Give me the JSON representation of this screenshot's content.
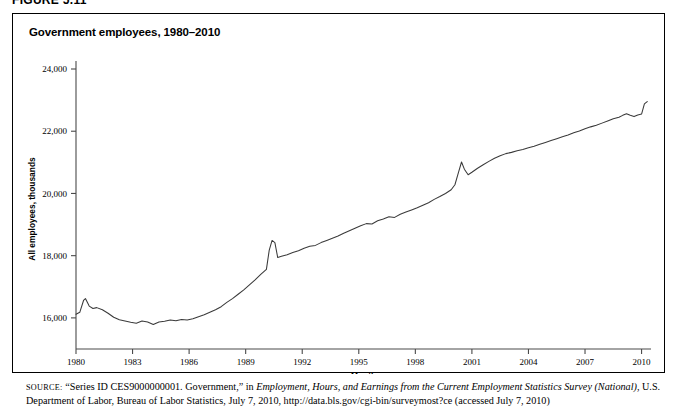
{
  "figure": {
    "number": "FIGURE 5.11"
  },
  "chart_panel": {
    "title": "Government employees, 1980–2010"
  },
  "source": {
    "label": "SOURCE:",
    "part1": " “Series ID CES9000000001. Government,” in ",
    "italic1": "Employment, Hours, and Earnings from the Current Employment Statistics Survey (National)",
    "part2": ", U.S. Department of Labor, Bureau of Labor Statistics, July 7, 2010, http://data.bls.gov/cgi-bin/surveymost?ce (accessed July 7, 2010)"
  },
  "chart_data": {
    "type": "line",
    "title": "Government employees, 1980–2010",
    "xlabel": "Month",
    "ylabel": "All employees, thousands",
    "xlim": [
      1980,
      2010.5
    ],
    "ylim": [
      15000,
      24000
    ],
    "xticks": [
      1980,
      1983,
      1986,
      1989,
      1992,
      1995,
      1998,
      2001,
      2004,
      2007,
      2010
    ],
    "xtick_labels": [
      "1980",
      "1983",
      "1986",
      "1989",
      "1992",
      "1995",
      "1998",
      "2001",
      "2004",
      "2007",
      "2010"
    ],
    "yticks": [
      16000,
      18000,
      20000,
      22000,
      24000
    ],
    "ytick_labels": [
      "16,000",
      "18,000",
      "20,000",
      "22,000",
      "24,000"
    ],
    "grid": false,
    "legend": false,
    "series": [
      {
        "name": "Government employees (All employees, thousands)",
        "color": "#3a3a3a",
        "x": [
          1980.0,
          1980.2,
          1980.4,
          1980.5,
          1980.7,
          1980.9,
          1981.1,
          1981.4,
          1981.7,
          1982.0,
          1982.3,
          1982.6,
          1982.9,
          1983.2,
          1983.5,
          1983.8,
          1984.1,
          1984.4,
          1984.7,
          1985.0,
          1985.3,
          1985.6,
          1985.9,
          1986.2,
          1986.5,
          1986.8,
          1987.1,
          1987.4,
          1987.7,
          1988.0,
          1988.3,
          1988.6,
          1988.9,
          1989.2,
          1989.5,
          1989.8,
          1990.1,
          1990.25,
          1990.4,
          1990.55,
          1990.7,
          1990.9,
          1991.2,
          1991.5,
          1991.8,
          1992.1,
          1992.4,
          1992.7,
          1993.0,
          1993.3,
          1993.6,
          1993.9,
          1994.2,
          1994.5,
          1994.8,
          1995.1,
          1995.4,
          1995.7,
          1996.0,
          1996.3,
          1996.6,
          1996.9,
          1997.2,
          1997.5,
          1997.8,
          1998.1,
          1998.4,
          1998.7,
          1999.0,
          1999.3,
          1999.6,
          1999.9,
          2000.1,
          2000.3,
          2000.45,
          2000.6,
          2000.8,
          2001.0,
          2001.3,
          2001.6,
          2001.9,
          2002.2,
          2002.5,
          2002.8,
          2003.1,
          2003.4,
          2003.7,
          2004.0,
          2004.3,
          2004.6,
          2004.9,
          2005.2,
          2005.5,
          2005.8,
          2006.1,
          2006.4,
          2006.7,
          2007.0,
          2007.3,
          2007.6,
          2007.9,
          2008.2,
          2008.5,
          2008.8,
          2009.0,
          2009.2,
          2009.4,
          2009.6,
          2009.8,
          2010.0,
          2010.15,
          2010.3
        ],
        "y": [
          16120,
          16180,
          16560,
          16620,
          16380,
          16300,
          16330,
          16260,
          16150,
          16020,
          15940,
          15900,
          15860,
          15830,
          15900,
          15870,
          15790,
          15870,
          15890,
          15930,
          15910,
          15950,
          15930,
          15970,
          16040,
          16100,
          16180,
          16260,
          16360,
          16500,
          16620,
          16760,
          16900,
          17060,
          17220,
          17400,
          17560,
          18180,
          18490,
          18420,
          17940,
          17980,
          18030,
          18100,
          18160,
          18240,
          18300,
          18330,
          18420,
          18490,
          18560,
          18630,
          18720,
          18800,
          18880,
          18960,
          19030,
          19020,
          19120,
          19180,
          19250,
          19230,
          19330,
          19400,
          19470,
          19540,
          19620,
          19700,
          19810,
          19900,
          20000,
          20120,
          20280,
          20700,
          21010,
          20780,
          20600,
          20680,
          20810,
          20920,
          21030,
          21130,
          21210,
          21280,
          21320,
          21370,
          21410,
          21470,
          21520,
          21580,
          21640,
          21700,
          21760,
          21820,
          21880,
          21950,
          22010,
          22080,
          22140,
          22190,
          22260,
          22330,
          22400,
          22450,
          22510,
          22560,
          22510,
          22470,
          22520,
          22550,
          22880,
          22950
        ]
      }
    ],
    "annotations": [
      {
        "label": "1980 recession spike",
        "x": 1980.5,
        "y": 16620
      },
      {
        "label": "1990 Census hiring spike",
        "x": 1990.4,
        "y": 18490
      },
      {
        "label": "2000 Census hiring spike",
        "x": 2000.45,
        "y": 21010
      },
      {
        "label": "2010 Census hiring spike",
        "x": 2010.3,
        "y": 22950
      }
    ]
  }
}
